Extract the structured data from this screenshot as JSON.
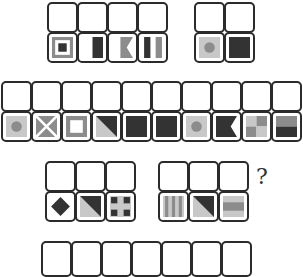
{
  "puzzle": {
    "question_mark": "?",
    "colors": {
      "dark": "#333333",
      "mid": "#8c8c8c",
      "light": "#c8c8c8",
      "white": "#ffffff",
      "border": "#2b2b2b"
    },
    "groups": [
      {
        "id": "word1",
        "x": 47,
        "y": 2,
        "tiles": [
          "square-in-square",
          "white-dark-vertical",
          "swallowtail-light",
          "dark-mid-vertical"
        ]
      },
      {
        "id": "word2",
        "x": 194,
        "y": 2,
        "tiles": [
          "circle-on-light",
          "solid-dark"
        ]
      },
      {
        "id": "word3",
        "x": 1,
        "y": 81,
        "tiles": [
          "circle-on-light",
          "saltire-white",
          "white-square-in-mid",
          "diagonal-dark-light",
          "solid-dark",
          "solid-dark",
          "circle-on-light",
          "swallowtail-dark",
          "checker-light-mid",
          "mid-over-dark"
        ]
      },
      {
        "id": "word4",
        "x": 45,
        "y": 161,
        "tiles": [
          "diamond-dark",
          "diagonal-dark-light",
          "four-dark-squares"
        ]
      },
      {
        "id": "word5",
        "x": 158,
        "y": 161,
        "tiles": [
          "vertical-stripes-mid",
          "diagonal-dark-light",
          "horizontal-band-mid"
        ]
      },
      {
        "id": "answer",
        "x": 41,
        "y": 241,
        "tiles": [
          "blank",
          "blank",
          "blank",
          "blank",
          "blank",
          "blank",
          "blank"
        ],
        "answer_row": true
      }
    ]
  }
}
